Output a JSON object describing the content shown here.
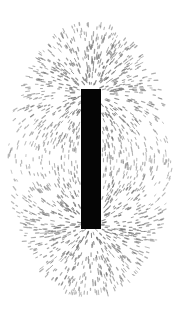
{
  "image": {
    "subject": "Iron filings aligned around a bar magnet",
    "width": 177,
    "height": 315,
    "background": "#ffffff"
  },
  "magnet": {
    "x": 81,
    "y": 89,
    "width": 20,
    "height": 140,
    "color": "#050505"
  },
  "filings": {
    "color": "#6e6e6e",
    "ellipse_center_x": 90,
    "ellipse_center_y": 160,
    "ellipse_radius_x": 82,
    "ellipse_radius_y": 138,
    "count": 2600
  }
}
